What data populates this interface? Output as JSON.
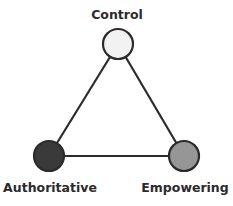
{
  "diagram": {
    "nodes": [
      {
        "id": "control",
        "label": "Control",
        "fill": "#f2f2f2",
        "stroke": "#2b2b2b",
        "cx": 118,
        "cy": 44,
        "label_x": 117,
        "label_y": 8
      },
      {
        "id": "authoritative",
        "label": "Authoritative",
        "fill": "#3a3a3a",
        "stroke": "#2b2b2b",
        "cx": 49,
        "cy": 156,
        "label_x": 50,
        "label_y": 181
      },
      {
        "id": "empowering",
        "label": "Empowering",
        "fill": "#969696",
        "stroke": "#2b2b2b",
        "cx": 184,
        "cy": 156,
        "label_x": 185,
        "label_y": 181
      }
    ],
    "edges": [
      {
        "from": "control",
        "to": "authoritative"
      },
      {
        "from": "control",
        "to": "empowering"
      },
      {
        "from": "authoritative",
        "to": "empowering"
      }
    ],
    "line_color": "#2b2b2b"
  }
}
